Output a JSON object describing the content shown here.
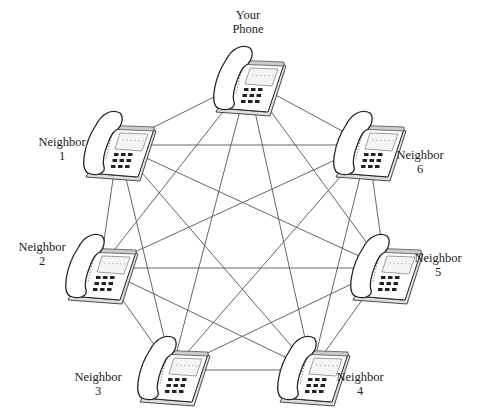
{
  "diagram": {
    "type": "fully-connected-network",
    "line_color": "#555555",
    "phone_outline_color": "#222222",
    "nodes": [
      {
        "id": "you",
        "label_line1": "Your",
        "label_line2": "Phone",
        "x": 248,
        "y": 80
      },
      {
        "id": "n1",
        "label_line1": "Neighbor",
        "label_line2": "1",
        "x": 118,
        "y": 145
      },
      {
        "id": "n6",
        "label_line1": "Neighbor",
        "label_line2": "6",
        "x": 368,
        "y": 145
      },
      {
        "id": "n2",
        "label_line1": "Neighbor",
        "label_line2": "2",
        "x": 100,
        "y": 268
      },
      {
        "id": "n5",
        "label_line1": "Neighbor",
        "label_line2": "5",
        "x": 385,
        "y": 268
      },
      {
        "id": "n3",
        "label_line1": "Neighbor",
        "label_line2": "3",
        "x": 172,
        "y": 370
      },
      {
        "id": "n4",
        "label_line1": "Neighbor",
        "label_line2": "4",
        "x": 312,
        "y": 370
      }
    ],
    "connection_count": 21
  }
}
